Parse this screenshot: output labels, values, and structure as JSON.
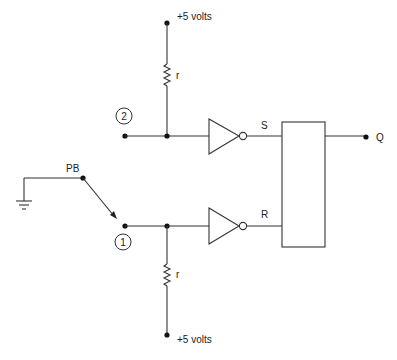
{
  "diagram": {
    "type": "circuit-schematic",
    "labels": {
      "vcc_top": "+5 volts",
      "vcc_bottom": "+5 volts",
      "resistor_top": "r",
      "resistor_bottom": "r",
      "node_2": "2",
      "node_1": "1",
      "pushbutton": "PB",
      "set_input": "S",
      "reset_input": "R",
      "output": "Q"
    },
    "components": [
      {
        "id": "vcc_top",
        "kind": "supply",
        "label": "+5 volts"
      },
      {
        "id": "r_top",
        "kind": "resistor",
        "label": "r"
      },
      {
        "id": "node_2",
        "kind": "terminal",
        "label": "2"
      },
      {
        "id": "inv_top",
        "kind": "inverter",
        "output": "S"
      },
      {
        "id": "pb",
        "kind": "switch",
        "label": "PB",
        "common": "ground"
      },
      {
        "id": "node_1",
        "kind": "terminal",
        "label": "1"
      },
      {
        "id": "inv_bottom",
        "kind": "inverter",
        "output": "R"
      },
      {
        "id": "r_bottom",
        "kind": "resistor",
        "label": "r"
      },
      {
        "id": "vcc_bottom",
        "kind": "supply",
        "label": "+5 volts"
      },
      {
        "id": "latch",
        "kind": "sr-latch",
        "inputs": [
          "S",
          "R"
        ],
        "output": "Q"
      },
      {
        "id": "ground",
        "kind": "ground"
      }
    ],
    "colors": {
      "wire": "#333333",
      "node": "#111111",
      "background": "#ffffff"
    }
  }
}
